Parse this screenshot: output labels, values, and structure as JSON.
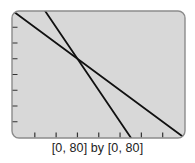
{
  "chart_data": {
    "type": "line",
    "title": "",
    "xlabel": "",
    "ylabel": "",
    "xlim": [
      0,
      80
    ],
    "ylim": [
      0,
      80
    ],
    "xtick_step": 10,
    "ytick_step": 10,
    "grid": false,
    "legend": null,
    "series": [
      {
        "name": "line 1 (y = 80 - x)",
        "slope": -1,
        "intercept": 80,
        "x": [
          0,
          80
        ],
        "y": [
          80,
          0
        ]
      },
      {
        "name": "line 2 (y = 110 - 2x)",
        "slope": -2,
        "intercept": 110,
        "x": [
          15,
          55
        ],
        "y": [
          80,
          0
        ]
      }
    ],
    "intersection": {
      "x": 30,
      "y": 50
    },
    "window_caption": "[0, 80] by [0, 80]"
  },
  "caption": "[0, 80] by [0, 80]",
  "colors": {
    "screen_bg": "#d8d8d8",
    "frame": "#8c8c8c",
    "line": "#111111",
    "tick": "#333333"
  }
}
